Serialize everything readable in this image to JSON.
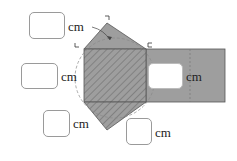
{
  "figure": {
    "colors": {
      "shape_fill": "#9e9e9e",
      "hatch": "#7a7a7a",
      "outline": "#555555",
      "dashed": "#8a8a8a"
    },
    "answer_boxes": [
      {
        "id": "top",
        "unit": "cm",
        "value": ""
      },
      {
        "id": "left",
        "unit": "cm",
        "value": ""
      },
      {
        "id": "bottom-left",
        "unit": "cm",
        "value": ""
      },
      {
        "id": "bottom-right",
        "unit": "cm",
        "value": ""
      }
    ],
    "inner_box": {
      "unit": "cm",
      "value": ""
    },
    "corner_labels": [
      "ㄱ",
      "ㄴ",
      "ㄷ"
    ]
  }
}
